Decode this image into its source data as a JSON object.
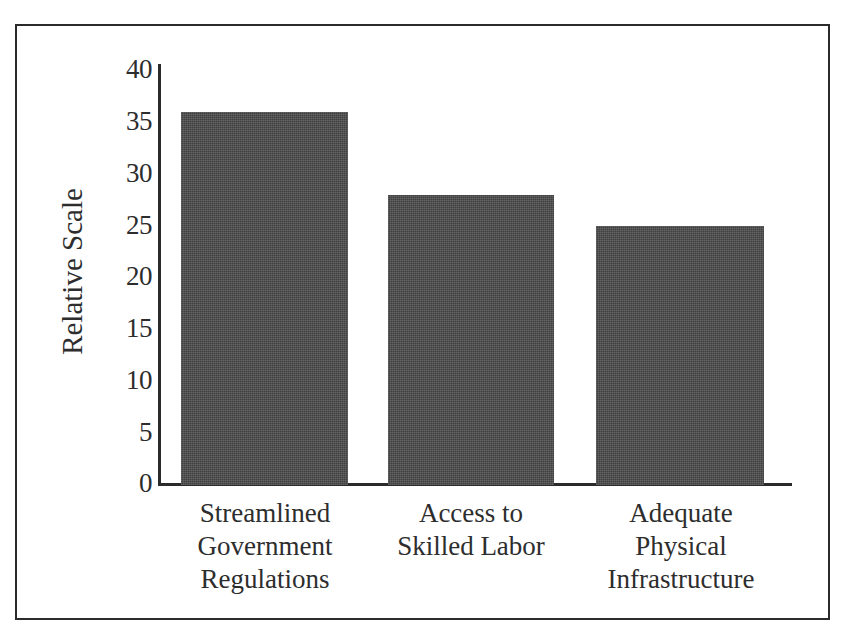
{
  "chart_data": {
    "type": "bar",
    "title": "",
    "subtitle": "",
    "xlabel": "",
    "ylabel": "Relative Scale",
    "categories": [
      "Streamlined Government Regulations",
      "Access to Skilled Labor",
      "Adequate Physical Infrastructure"
    ],
    "category_lines": [
      [
        "Streamlined",
        "Government",
        "Regulations"
      ],
      [
        "Access to",
        "Skilled Labor"
      ],
      [
        "Adequate",
        "Physical",
        "Infrastructure"
      ]
    ],
    "values": [
      36,
      28,
      25
    ],
    "ylim": [
      0,
      40
    ],
    "ytick_labels": [
      "40",
      "35",
      "30",
      "25",
      "20",
      "15",
      "10",
      "5",
      "0"
    ],
    "ytick_values": [
      40,
      35,
      30,
      25,
      20,
      15,
      10,
      5,
      0
    ],
    "grid": false,
    "legend": null,
    "legend_position": "none",
    "bar_color": "#3f3f3f",
    "axis_color": "#2b2b2b",
    "text_color": "#2d2d2d",
    "frame_color": "#2b2b2b",
    "background": "#ffffff"
  }
}
